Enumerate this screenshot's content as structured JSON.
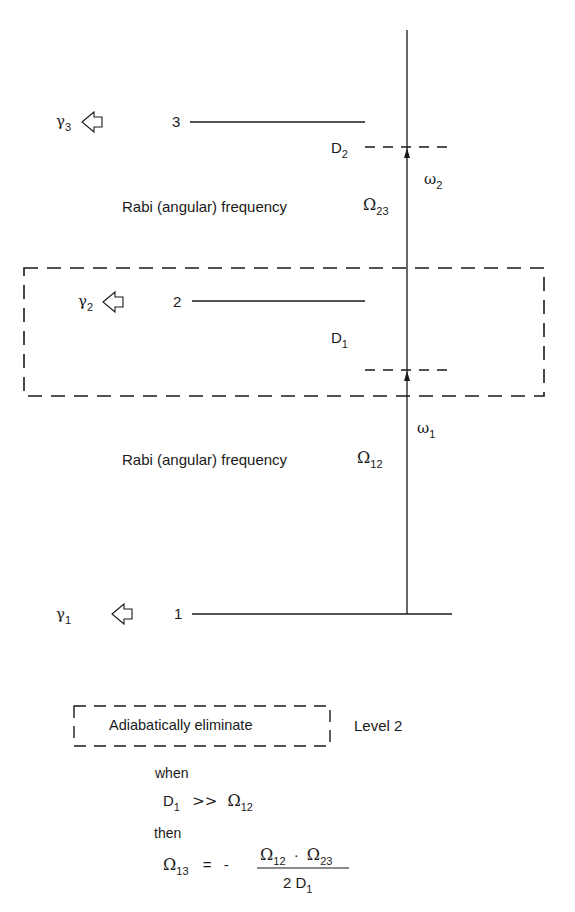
{
  "diagram": {
    "levels": [
      {
        "id": "3",
        "label": "3",
        "decay_symbol": "γ",
        "decay_sub": "3"
      },
      {
        "id": "2",
        "label": "2",
        "decay_symbol": "γ",
        "decay_sub": "2"
      },
      {
        "id": "1",
        "label": "1",
        "decay_symbol": "γ",
        "decay_sub": "1"
      }
    ],
    "detunings": [
      {
        "symbol": "D",
        "sub": "2"
      },
      {
        "symbol": "D",
        "sub": "1"
      }
    ],
    "fields": [
      {
        "symbol": "ω",
        "sub": "2"
      },
      {
        "symbol": "ω",
        "sub": "1"
      }
    ],
    "rabi": [
      {
        "label": "Rabi (angular) frequency",
        "symbol": "Ω",
        "sub": "23"
      },
      {
        "label": "Rabi (angular) frequency",
        "symbol": "Ω",
        "sub": "12"
      }
    ],
    "legend": {
      "boxed_text": "Adiabatically eliminate",
      "target": "Level 2"
    },
    "condition": {
      "when_label": "when",
      "lhs": "D",
      "lhs_sub": "1",
      "relation": ">>",
      "rhs": "Ω",
      "rhs_sub": "12"
    },
    "result": {
      "then_label": "then",
      "lhs": "Ω",
      "lhs_sub": "13",
      "equals": "=",
      "sign": "-",
      "num_a": "Ω",
      "num_a_sub": "12",
      "dot": "·",
      "num_b": "Ω",
      "num_b_sub": "23",
      "den": "2 D",
      "den_sub": "1"
    },
    "colors": {
      "ink": "#1a1a1a",
      "background": "#ffffff"
    }
  }
}
